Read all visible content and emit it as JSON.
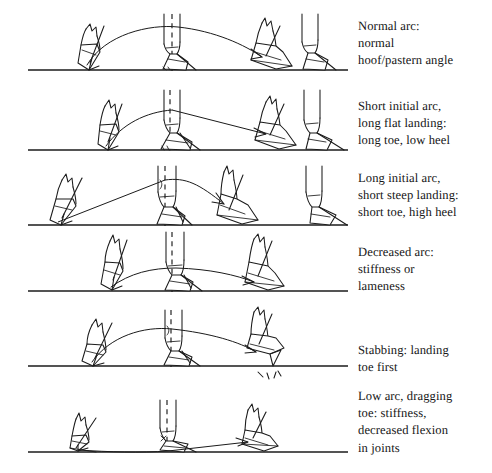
{
  "figure": {
    "title_visible": false,
    "background_color": "#ffffff",
    "ink_color": "#1b1b1b",
    "text_color": "#161616",
    "ground_line_label": "ground-line",
    "panel_count": 6,
    "panels": [
      {
        "id": "normal-arc",
        "caption": "Normal arc:\nnormal\nhoof/pastern angle",
        "caption_lines": [
          "Normal arc:",
          "normal",
          "hoof/pastern angle"
        ],
        "arc_type": "symmetric-normal",
        "baseline_y": 70,
        "hoof_positions": [
          "takeoff",
          "midstance",
          "landing",
          "standing"
        ],
        "has_plumb_line": true,
        "has_impact_marks": false
      },
      {
        "id": "short-initial-arc",
        "caption": "Short initial arc,\nlong flat landing:\nlong toe, low heel",
        "caption_lines": [
          "Short initial arc,",
          "long flat landing:",
          "long toe, low heel"
        ],
        "arc_type": "early-peak-long-flat",
        "baseline_y": 150,
        "hoof_positions": [
          "takeoff",
          "midstance",
          "landing",
          "standing"
        ],
        "has_plumb_line": true,
        "has_impact_marks": false
      },
      {
        "id": "long-initial-arc",
        "caption": "Long initial arc,\nshort steep landing:\nshort toe, high heel",
        "caption_lines": [
          "Long initial arc,",
          "short steep landing:",
          "short toe, high heel"
        ],
        "arc_type": "late-peak-steep-drop",
        "baseline_y": 225,
        "hoof_positions": [
          "takeoff",
          "midstance",
          "landing",
          "standing"
        ],
        "has_plumb_line": true,
        "has_impact_marks": false
      },
      {
        "id": "decreased-arc",
        "caption": "Decreased arc:\nstiffness or\nlameness",
        "caption_lines": [
          "Decreased arc:",
          "stiffness or",
          "lameness"
        ],
        "arc_type": "low-flat-symmetric",
        "baseline_y": 291,
        "hoof_positions": [
          "takeoff",
          "midstance",
          "landing"
        ],
        "has_plumb_line": true,
        "has_impact_marks": false
      },
      {
        "id": "stabbing",
        "caption": "Stabbing: landing\ntoe first",
        "caption_lines": [
          "Stabbing: landing",
          "toe first"
        ],
        "arc_type": "normal-arc-toe-strike",
        "baseline_y": 366,
        "hoof_positions": [
          "takeoff",
          "midstance",
          "landing"
        ],
        "has_plumb_line": true,
        "has_impact_marks": true
      },
      {
        "id": "low-arc-dragging-toe",
        "caption": "Low arc, dragging\ntoe: stiffness,\ndecreased flexion\nin joints",
        "caption_lines": [
          "Low arc, dragging",
          "toe: stiffness,",
          "decreased flexion",
          "in joints"
        ],
        "arc_type": "dragging-near-ground",
        "baseline_y": 452,
        "hoof_positions": [
          "takeoff",
          "midstance",
          "landing"
        ],
        "has_plumb_line": true,
        "has_impact_marks": false
      }
    ]
  }
}
